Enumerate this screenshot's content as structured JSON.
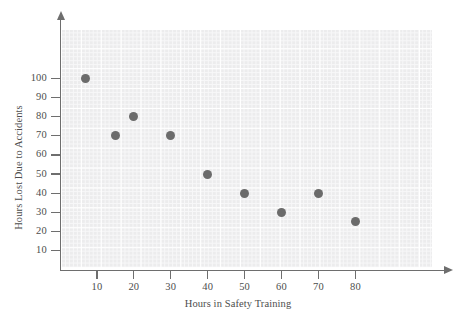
{
  "chart_data": {
    "type": "scatter",
    "title": "",
    "xlabel": "Hours in Safety Training",
    "ylabel": "Hours Lost Due to Accidents",
    "xlim": [
      0,
      85
    ],
    "ylim": [
      0,
      115
    ],
    "xticks": [
      10,
      20,
      30,
      40,
      50,
      60,
      70,
      80
    ],
    "yticks": [
      10,
      20,
      30,
      40,
      50,
      60,
      70,
      80,
      90,
      100
    ],
    "grid": true,
    "legend": null,
    "point_color": "#6b6b6b",
    "points": [
      {
        "x": 7,
        "y": 100
      },
      {
        "x": 15,
        "y": 70
      },
      {
        "x": 20,
        "y": 80
      },
      {
        "x": 30,
        "y": 70
      },
      {
        "x": 40,
        "y": 50
      },
      {
        "x": 50,
        "y": 40
      },
      {
        "x": 60,
        "y": 30
      },
      {
        "x": 70,
        "y": 40
      },
      {
        "x": 80,
        "y": 25
      }
    ],
    "x": [
      7,
      15,
      20,
      30,
      40,
      50,
      60,
      70,
      80
    ],
    "values": [
      100,
      70,
      80,
      70,
      50,
      40,
      30,
      40,
      25
    ]
  }
}
